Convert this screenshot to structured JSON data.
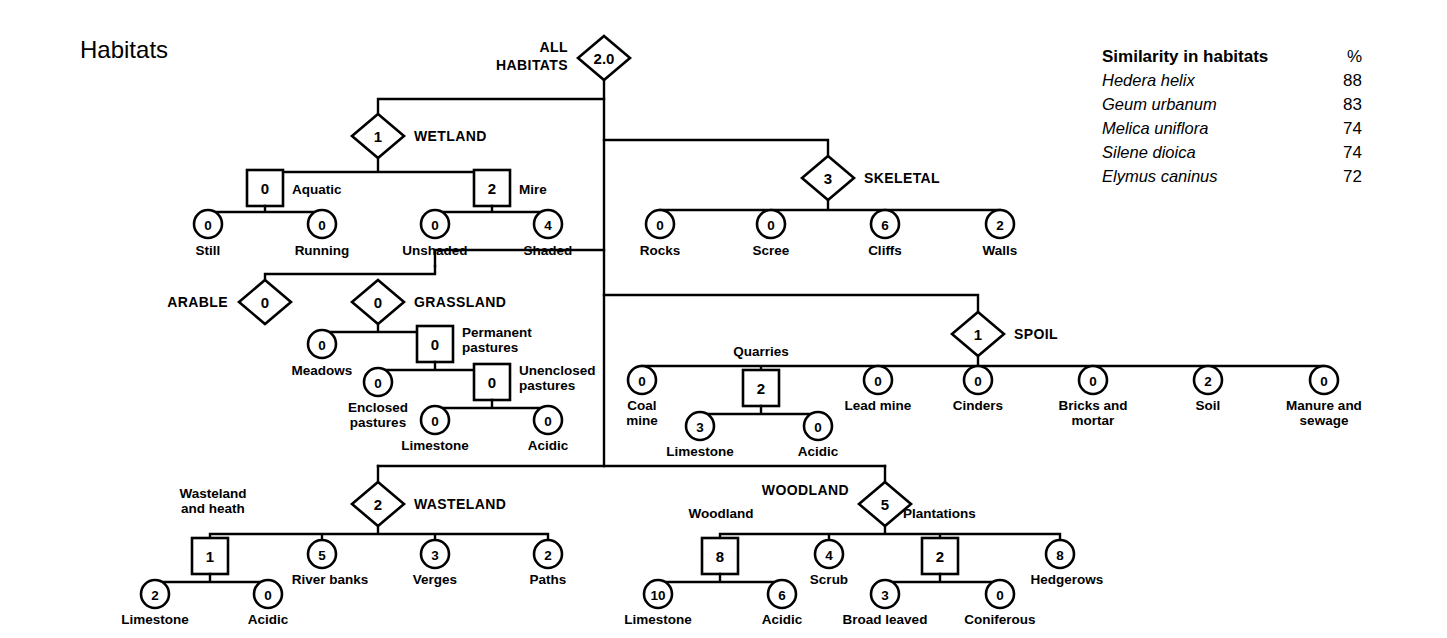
{
  "title": "Habitats",
  "legend": {
    "heading": "Similarity in habitats",
    "unit_header": "%",
    "rows": [
      {
        "species": "Hedera helix",
        "value": "88"
      },
      {
        "species": "Geum urbanum",
        "value": "83"
      },
      {
        "species": "Melica uniflora",
        "value": "74"
      },
      {
        "species": "Silene dioica",
        "value": "74"
      },
      {
        "species": "Elymus caninus",
        "value": "72"
      }
    ]
  },
  "root": {
    "label": "ALL\nHABITATS",
    "label_line1": "ALL",
    "label_line2": "HABITATS",
    "value": "2.0",
    "shape": "diamond"
  },
  "branches": {
    "wetland": {
      "label": "WETLAND",
      "value": "1",
      "shape": "diamond",
      "children": [
        {
          "label": "Aquatic",
          "value": "0",
          "shape": "square",
          "children": [
            {
              "label": "Still",
              "value": "0",
              "shape": "circle"
            },
            {
              "label": "Running",
              "value": "0",
              "shape": "circle"
            }
          ]
        },
        {
          "label": "Mire",
          "value": "2",
          "shape": "square",
          "children": [
            {
              "label": "Unshaded",
              "value": "0",
              "shape": "circle"
            },
            {
              "label": "Shaded",
              "value": "4",
              "shape": "circle"
            }
          ]
        }
      ]
    },
    "skeletal": {
      "label": "SKELETAL",
      "value": "3",
      "shape": "diamond",
      "children": [
        {
          "label": "Rocks",
          "value": "0",
          "shape": "circle"
        },
        {
          "label": "Scree",
          "value": "0",
          "shape": "circle"
        },
        {
          "label": "Cliffs",
          "value": "6",
          "shape": "circle"
        },
        {
          "label": "Walls",
          "value": "2",
          "shape": "circle"
        }
      ]
    },
    "arable": {
      "label": "ARABLE",
      "value": "0",
      "shape": "diamond",
      "children": []
    },
    "grassland": {
      "label": "GRASSLAND",
      "value": "0",
      "shape": "diamond",
      "children": [
        {
          "label": "Meadows",
          "value": "0",
          "shape": "circle"
        },
        {
          "label": "Permanent\npastures",
          "label_line1": "Permanent",
          "label_line2": "pastures",
          "value": "0",
          "shape": "square",
          "children": [
            {
              "label": "Enclosed\npastures",
              "label_line1": "Enclosed",
              "label_line2": "pastures",
              "value": "0",
              "shape": "circle"
            },
            {
              "label": "Unenclosed\npastures",
              "label_line1": "Unenclosed",
              "label_line2": "pastures",
              "value": "0",
              "shape": "square",
              "children": [
                {
                  "label": "Limestone",
                  "value": "0",
                  "shape": "circle"
                },
                {
                  "label": "Acidic",
                  "value": "0",
                  "shape": "circle"
                }
              ]
            }
          ]
        }
      ]
    },
    "spoil": {
      "label": "SPOIL",
      "value": "1",
      "shape": "diamond",
      "children": [
        {
          "label": "Coal\nmine",
          "label_line1": "Coal",
          "label_line2": "mine",
          "value": "0",
          "shape": "circle"
        },
        {
          "label": "Quarries",
          "value": "2",
          "shape": "square",
          "children": [
            {
              "label": "Limestone",
              "value": "3",
              "shape": "circle"
            },
            {
              "label": "Acidic",
              "value": "0",
              "shape": "circle"
            }
          ]
        },
        {
          "label": "Lead mine",
          "value": "0",
          "shape": "circle"
        },
        {
          "label": "Cinders",
          "value": "0",
          "shape": "circle"
        },
        {
          "label": "Bricks and\nmortar",
          "label_line1": "Bricks and",
          "label_line2": "mortar",
          "value": "0",
          "shape": "circle"
        },
        {
          "label": "Soil",
          "value": "2",
          "shape": "circle"
        },
        {
          "label": "Manure and\nsewage",
          "label_line1": "Manure and",
          "label_line2": "sewage",
          "value": "0",
          "shape": "circle"
        }
      ]
    },
    "wasteland": {
      "label": "WASTELAND",
      "value": "2",
      "shape": "diamond",
      "children": [
        {
          "label": "Wasteland\nand heath",
          "label_line1": "Wasteland",
          "label_line2": "and heath",
          "value": "1",
          "shape": "square",
          "children": [
            {
              "label": "Limestone",
              "value": "2",
              "shape": "circle"
            },
            {
              "label": "Acidic",
              "value": "0",
              "shape": "circle"
            }
          ]
        },
        {
          "label": "River banks",
          "value": "5",
          "shape": "circle"
        },
        {
          "label": "Verges",
          "value": "3",
          "shape": "circle"
        },
        {
          "label": "Paths",
          "value": "2",
          "shape": "circle"
        }
      ]
    },
    "woodland": {
      "label": "WOODLAND",
      "value": "5",
      "shape": "diamond",
      "children": [
        {
          "label": "Woodland",
          "value": "8",
          "shape": "square",
          "children": [
            {
              "label": "Limestone",
              "value": "10",
              "shape": "circle"
            },
            {
              "label": "Acidic",
              "value": "6",
              "shape": "circle"
            }
          ]
        },
        {
          "label": "Scrub",
          "value": "4",
          "shape": "circle"
        },
        {
          "label": "Plantations",
          "value": "2",
          "shape": "square",
          "children": [
            {
              "label": "Broad leaved",
              "value": "3",
              "shape": "circle"
            },
            {
              "label": "Coniferous",
              "value": "0",
              "shape": "circle"
            }
          ]
        },
        {
          "label": "Hedgerows",
          "value": "8",
          "shape": "circle"
        }
      ]
    }
  }
}
